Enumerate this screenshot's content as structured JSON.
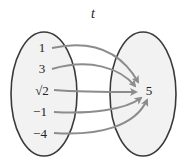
{
  "diagram": {
    "title": "t",
    "domain_set": {
      "elements": [
        "1",
        "3",
        "√2",
        "−1",
        "−4"
      ]
    },
    "codomain_set": {
      "elements": [
        "5"
      ]
    },
    "mappings": [
      {
        "from": "1",
        "to": "5"
      },
      {
        "from": "3",
        "to": "5"
      },
      {
        "from": "√2",
        "to": "5"
      },
      {
        "from": "−1",
        "to": "5"
      },
      {
        "from": "−4",
        "to": "5"
      }
    ],
    "colors": {
      "ellipse_fill": "#f2f2f2",
      "ellipse_stroke": "#3a3a3a",
      "arrow": "#8c8c8c",
      "text": "#222222"
    }
  }
}
